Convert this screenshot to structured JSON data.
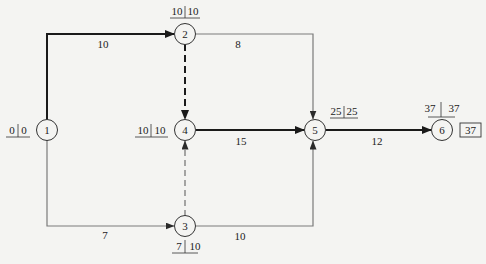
{
  "diagram": {
    "type": "double-code network diagram (critical path)",
    "nodes": [
      {
        "id": "1",
        "label": "1",
        "cx": 47,
        "cy": 130,
        "et": "0",
        "lt": "0",
        "tag_pos": "left"
      },
      {
        "id": "2",
        "label": "2",
        "cx": 185,
        "cy": 34,
        "et": "10",
        "lt": "10",
        "tag_pos": "top"
      },
      {
        "id": "3",
        "label": "3",
        "cx": 185,
        "cy": 226,
        "et": "7",
        "lt": "10",
        "tag_pos": "bottom"
      },
      {
        "id": "4",
        "label": "4",
        "cx": 185,
        "cy": 130,
        "et": "10",
        "lt": "10",
        "tag_pos": "left"
      },
      {
        "id": "5",
        "label": "5",
        "cx": 315,
        "cy": 130,
        "et": "25",
        "lt": "25",
        "tag_pos": "topright"
      },
      {
        "id": "6",
        "label": "6",
        "cx": 442,
        "cy": 130,
        "et": "37",
        "lt": "37",
        "tag_pos": "top"
      }
    ],
    "edges": [
      {
        "from": "1",
        "to": "2",
        "duration": "10",
        "critical": true,
        "dummy": false
      },
      {
        "from": "1",
        "to": "3",
        "duration": "7",
        "critical": false,
        "dummy": false
      },
      {
        "from": "2",
        "to": "4",
        "duration": "",
        "critical": true,
        "dummy": true
      },
      {
        "from": "3",
        "to": "4",
        "duration": "",
        "critical": false,
        "dummy": true
      },
      {
        "from": "2",
        "to": "5",
        "duration": "8",
        "critical": false,
        "dummy": false
      },
      {
        "from": "4",
        "to": "5",
        "duration": "15",
        "critical": true,
        "dummy": false
      },
      {
        "from": "3",
        "to": "5",
        "duration": "10",
        "critical": false,
        "dummy": false
      },
      {
        "from": "5",
        "to": "6",
        "duration": "12",
        "critical": true,
        "dummy": false
      }
    ],
    "total_duration": "37",
    "colors": {
      "critical": "#1a1a1a",
      "normal": "#7a7a7a",
      "background": "#f4f4f2"
    }
  }
}
